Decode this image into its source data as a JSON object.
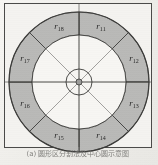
{
  "figure": {
    "caption": "(a) 圆形区分割法及中心圆示意图",
    "center_label": "",
    "geometry": {
      "center_x": 79,
      "center_y": 82,
      "outer_radius": 70,
      "inner_radius": 47,
      "hub_radius": 13,
      "hub_dot_radius": 3
    },
    "colors": {
      "ring_fill": "#b9b9b7",
      "inner_fill": "#f7f6f3",
      "stroke": "#3a3a38",
      "frame": "#4a4a48",
      "page": "#f4f3f0",
      "label_text": "#2b2b2b",
      "caption_text": "#6d6c69"
    },
    "sectors": [
      {
        "id": "r11",
        "base": "r",
        "sub": "11",
        "start_deg": 45,
        "end_deg": 90,
        "label_x": 101,
        "label_y": 26
      },
      {
        "id": "r12",
        "base": "r",
        "sub": "12",
        "start_deg": 0,
        "end_deg": 45,
        "label_x": 134,
        "label_y": 58
      },
      {
        "id": "r13",
        "base": "r",
        "sub": "13",
        "start_deg": 315,
        "end_deg": 360,
        "label_x": 134,
        "label_y": 103
      },
      {
        "id": "r14",
        "base": "r",
        "sub": "14",
        "start_deg": 270,
        "end_deg": 315,
        "label_x": 101,
        "label_y": 135
      },
      {
        "id": "r15",
        "base": "r",
        "sub": "15",
        "start_deg": 225,
        "end_deg": 270,
        "label_x": 59,
        "label_y": 135
      },
      {
        "id": "r16",
        "base": "r",
        "sub": "16",
        "start_deg": 180,
        "end_deg": 225,
        "label_x": 25,
        "label_y": 103
      },
      {
        "id": "r17",
        "base": "r",
        "sub": "17",
        "start_deg": 135,
        "end_deg": 180,
        "label_x": 25,
        "label_y": 58
      },
      {
        "id": "r18",
        "base": "r",
        "sub": "18",
        "start_deg": 90,
        "end_deg": 135,
        "label_x": 59,
        "label_y": 26
      }
    ],
    "spoke_angles_deg": [
      0,
      45,
      90,
      135,
      180,
      225,
      270,
      315
    ]
  }
}
